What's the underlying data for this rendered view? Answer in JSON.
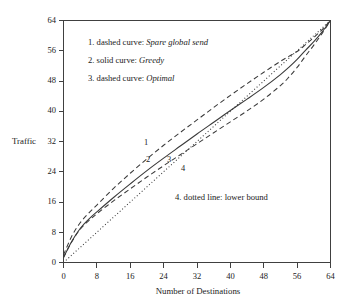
{
  "chart_data": {
    "type": "line",
    "title": "",
    "xlabel": "Number of Destinations",
    "ylabel": "Traffic",
    "xlim": [
      0,
      64
    ],
    "ylim": [
      0,
      64
    ],
    "xticks": [
      0,
      8,
      16,
      24,
      32,
      40,
      48,
      56,
      64
    ],
    "yticks": [
      0,
      8,
      16,
      24,
      32,
      40,
      48,
      56,
      64
    ],
    "xtick_labels": [
      "0",
      "8",
      "16",
      "24",
      "32",
      "40",
      "48",
      "56",
      "64"
    ],
    "ytick_labels": [
      "0",
      "8",
      "16",
      "24",
      "32",
      "40",
      "48",
      "56",
      "64"
    ],
    "grid": false,
    "legend_position": "upper-left-inside",
    "x": [
      0,
      2,
      4,
      6,
      8,
      12,
      16,
      20,
      24,
      28,
      32,
      36,
      40,
      44,
      48,
      52,
      54,
      56,
      58,
      60,
      62,
      64
    ],
    "series": [
      {
        "name": "Spare global send",
        "tag": "1",
        "style": "dashed",
        "values": [
          2.0,
          7.0,
          10.5,
          13.0,
          15.2,
          19.6,
          23.6,
          27.4,
          31.0,
          34.4,
          37.7,
          41.0,
          44.2,
          47.3,
          50.3,
          53.2,
          54.5,
          55.8,
          57.6,
          59.5,
          61.6,
          64.0
        ]
      },
      {
        "name": "Greedy",
        "tag": "2",
        "style": "solid",
        "values": [
          1.3,
          5.6,
          9.0,
          11.4,
          13.4,
          17.2,
          20.8,
          24.3,
          27.6,
          30.8,
          34.0,
          37.1,
          40.2,
          43.2,
          46.3,
          49.7,
          51.6,
          53.7,
          56.1,
          58.4,
          61.0,
          64.0
        ]
      },
      {
        "name": "Optimal",
        "tag": "3",
        "style": "dashed",
        "values": [
          1.3,
          5.5,
          8.8,
          11.0,
          12.9,
          16.3,
          19.5,
          22.6,
          25.6,
          28.5,
          31.4,
          34.3,
          37.2,
          40.1,
          43.2,
          46.8,
          49.0,
          51.6,
          54.6,
          57.5,
          60.6,
          64.0
        ]
      },
      {
        "name": "lower bound",
        "tag": "4",
        "style": "dotted",
        "values": [
          0.0,
          2.0,
          4.0,
          6.0,
          8.0,
          12.0,
          16.0,
          20.0,
          24.0,
          28.0,
          32.0,
          36.0,
          40.0,
          44.0,
          48.0,
          52.0,
          54.0,
          56.0,
          58.0,
          60.0,
          62.0,
          64.0
        ]
      }
    ],
    "curve_tags": [
      {
        "tag": "1",
        "x": 20.0,
        "y": 31.0
      },
      {
        "tag": "2",
        "x": 20.5,
        "y": 26.3
      },
      {
        "tag": "3",
        "x": 25.6,
        "y": 26.3
      },
      {
        "tag": "4",
        "x": 29.0,
        "y": 24.2
      }
    ],
    "annotations": [
      {
        "id": "legend-1",
        "number": "1.",
        "kind": "dashed curve:",
        "label": "Spare global send",
        "italic": true
      },
      {
        "id": "legend-2",
        "number": "2.",
        "kind": "solid curve:",
        "label": "Greedy",
        "italic": true
      },
      {
        "id": "legend-3",
        "number": "3.",
        "kind": "dashed curve:",
        "label": "Optimal",
        "italic": true
      },
      {
        "id": "legend-4",
        "number": "4.",
        "kind": "dotted line:",
        "label": "lower bound",
        "italic": false
      }
    ]
  },
  "legend": {
    "line1_number": "1.",
    "line1_kind": "dashed curve:",
    "line1_name": "Spare global send",
    "line2_number": "2.",
    "line2_kind": "solid curve:",
    "line2_name": "Greedy",
    "line3_number": "3.",
    "line3_kind": "dashed curve:",
    "line3_name": "Optimal",
    "line4_number": "4.",
    "line4_kind": "dotted line:",
    "line4_name": "lower bound"
  },
  "axes": {
    "y_title": "Traffic",
    "x_title": "Number of Destinations"
  },
  "colors": {
    "ink": "#1a1a1a",
    "axis": "#404040",
    "curve": "#3a3a3a",
    "background": "#ffffff"
  }
}
